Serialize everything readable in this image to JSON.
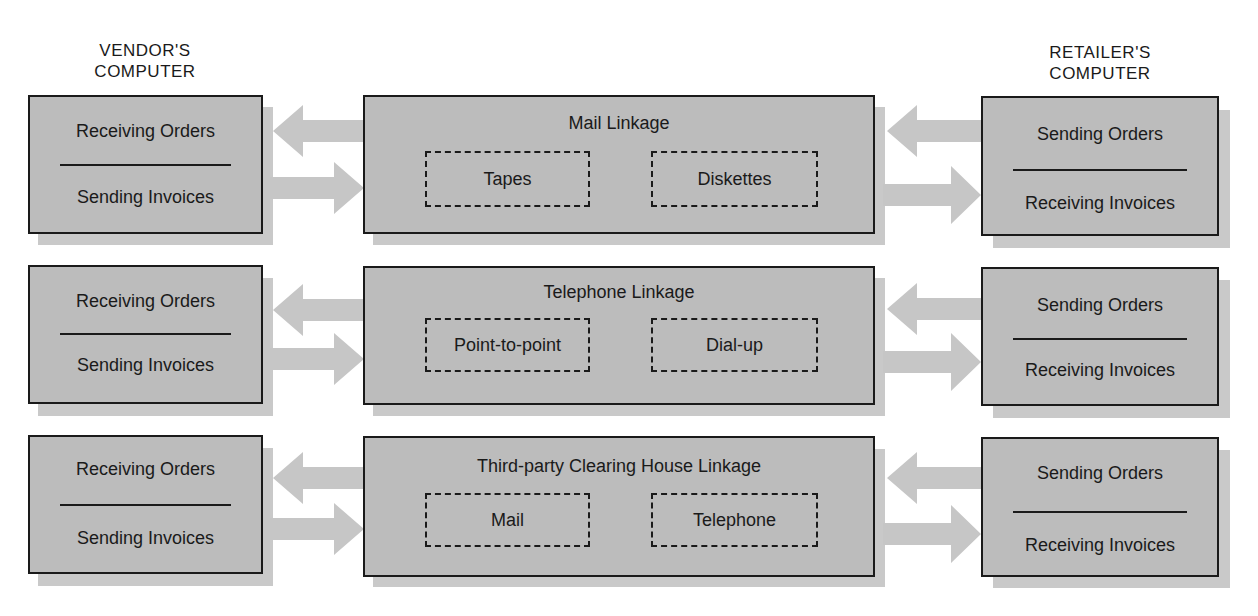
{
  "columns": {
    "vendor": {
      "title_line1": "VENDOR'S",
      "title_line2": "COMPUTER"
    },
    "retailer": {
      "title_line1": "RETAILER'S",
      "title_line2": "COMPUTER"
    }
  },
  "rows": [
    {
      "vendor": {
        "top": "Receiving Orders",
        "bottom": "Sending Invoices"
      },
      "linkage": {
        "title": "Mail Linkage",
        "options": [
          "Tapes",
          "Diskettes"
        ]
      },
      "retailer": {
        "top": "Sending Orders",
        "bottom": "Receiving Invoices"
      }
    },
    {
      "vendor": {
        "top": "Receiving Orders",
        "bottom": "Sending Invoices"
      },
      "linkage": {
        "title": "Telephone Linkage",
        "options": [
          "Point-to-point",
          "Dial-up"
        ]
      },
      "retailer": {
        "top": "Sending Orders",
        "bottom": "Receiving Invoices"
      }
    },
    {
      "vendor": {
        "top": "Receiving Orders",
        "bottom": "Sending Invoices"
      },
      "linkage": {
        "title": "Third-party Clearing House Linkage",
        "options": [
          "Mail",
          "Telephone"
        ]
      },
      "retailer": {
        "top": "Sending Orders",
        "bottom": "Receiving Invoices"
      }
    }
  ],
  "colors": {
    "box_fill": "#bcbcbc",
    "shadow": "#c9c9c9",
    "arrow": "#c6c6c6",
    "border": "#1a1a1a"
  }
}
